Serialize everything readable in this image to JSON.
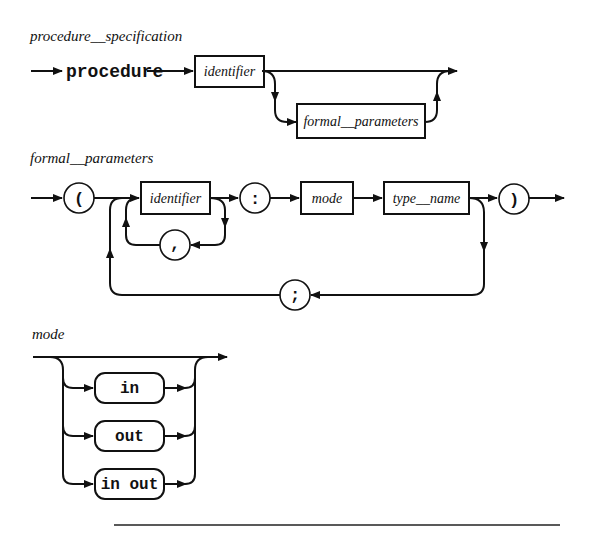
{
  "diagrams": {
    "procedure_specification": {
      "title": "procedure__specification",
      "keyword": "procedure",
      "identifier": "identifier",
      "formal_parameters": "formal__parameters"
    },
    "formal_parameters": {
      "title": "formal__parameters",
      "open_paren": "(",
      "identifier": "identifier",
      "comma": ",",
      "colon": ":",
      "mode": "mode",
      "type_name": "type__name",
      "close_paren": ")",
      "semicolon": ";"
    },
    "mode": {
      "title": "mode",
      "options": [
        "in",
        "out",
        "in out"
      ]
    }
  }
}
